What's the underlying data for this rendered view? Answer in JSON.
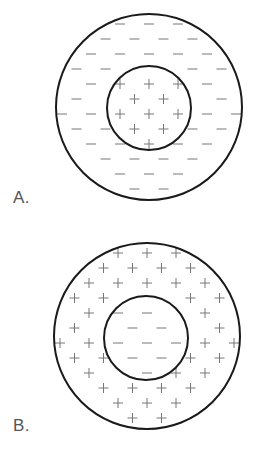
{
  "diagrams": [
    {
      "id": "A",
      "label": "A.",
      "outer_charge": "-",
      "inner_charge": "+",
      "outer_circle": {
        "cx": 149,
        "cy": 107,
        "r": 93
      },
      "inner_circle": {
        "cx": 149,
        "cy": 108,
        "r": 42
      }
    },
    {
      "id": "B",
      "label": "B.",
      "outer_charge": "+",
      "inner_charge": "-",
      "outer_circle": {
        "cx": 147,
        "cy": 110,
        "r": 93
      },
      "inner_circle": {
        "cx": 146,
        "cy": 112,
        "r": 42
      }
    }
  ],
  "colors": {
    "stroke": "#1a1a1a",
    "symbol": "#777777",
    "label": "#555555"
  }
}
